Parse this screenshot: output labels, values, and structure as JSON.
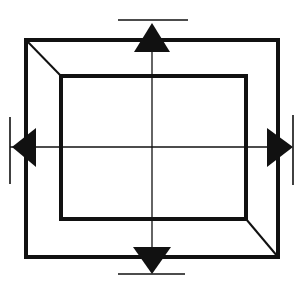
{
  "diagram": {
    "description": "Perspective frame with inner rectangle, center crosshair, and four outward-pointing arrows with stop bars",
    "stroke_color": "#111111",
    "fill_color": "#111111",
    "background": "#ffffff",
    "outer_rect": {
      "x1": 26,
      "y1": 40,
      "x2": 278,
      "y2": 257,
      "stroke_width": 4
    },
    "inner_rect": {
      "x1": 61,
      "y1": 76,
      "x2": 246,
      "y2": 219,
      "stroke_width": 4
    },
    "diagonals": [
      {
        "name": "top-left",
        "from": [
          26,
          40
        ],
        "to": [
          61,
          76
        ]
      },
      {
        "name": "bottom-right",
        "from": [
          246,
          219
        ],
        "to": [
          278,
          257
        ]
      }
    ],
    "crosshair": {
      "vertical": {
        "x": 152,
        "y1": 42,
        "y2": 254
      },
      "horizontal": {
        "y": 147,
        "x1": 10,
        "x2": 290
      }
    },
    "arrows": [
      {
        "direction": "up",
        "points": "152,23 134,52 170,52"
      },
      {
        "direction": "down",
        "points": "152,274 133,247 171,247"
      },
      {
        "direction": "left",
        "points": "12,147 36,128 36,167"
      },
      {
        "direction": "right",
        "points": "293,147 267,128 267,167"
      }
    ],
    "stop_bars": [
      {
        "direction": "up",
        "x1": 118,
        "y1": 20,
        "x2": 188,
        "y2": 20
      },
      {
        "direction": "down",
        "x1": 118,
        "y1": 274,
        "x2": 185,
        "y2": 274
      },
      {
        "direction": "left",
        "x1": 10,
        "y1": 117,
        "x2": 10,
        "y2": 184
      },
      {
        "direction": "right",
        "x1": 293,
        "y1": 115,
        "x2": 293,
        "y2": 185
      }
    ]
  }
}
